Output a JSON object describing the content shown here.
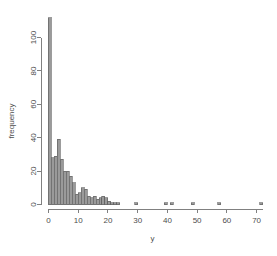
{
  "chart_data": {
    "type": "bar",
    "title": "",
    "subtitle": "",
    "xlabel": "y",
    "ylabel": "frequency",
    "xlim": [
      -1,
      74
    ],
    "ylim": [
      0,
      115
    ],
    "grid": false,
    "legend": null,
    "bin_width": 1,
    "x_ticks": [
      0,
      10,
      20,
      30,
      40,
      50,
      60,
      70
    ],
    "x_tick_labels": [
      "0",
      "10",
      "20",
      "30",
      "40",
      "50",
      "60",
      "70"
    ],
    "y_ticks": [
      0,
      20,
      40,
      60,
      80,
      100
    ],
    "y_tick_labels": [
      "0",
      "20",
      "40",
      "60",
      "80",
      "100"
    ],
    "bar_color": "#9a9a9a",
    "bar_border_color": "#5a5a5a",
    "axis_color": "#808080",
    "text_color": "#4d4d4d",
    "background": "#ffffff",
    "bin_starts": [
      0,
      1,
      2,
      3,
      4,
      5,
      6,
      7,
      8,
      9,
      10,
      11,
      12,
      13,
      14,
      15,
      16,
      17,
      18,
      19,
      20,
      21,
      22,
      23,
      24,
      25,
      26,
      27,
      28,
      29,
      30,
      31,
      32,
      33,
      34,
      35,
      36,
      37,
      38,
      39,
      40,
      41,
      42,
      43,
      44,
      45,
      46,
      47,
      48,
      49,
      50,
      51,
      52,
      53,
      54,
      55,
      56,
      57,
      58,
      59,
      60,
      61,
      62,
      63,
      64,
      65,
      66,
      67,
      68,
      69,
      70,
      71
    ],
    "values": [
      112,
      28,
      29,
      39,
      27,
      20,
      20,
      17,
      13,
      6,
      7,
      10,
      9,
      5,
      4,
      5,
      3,
      4,
      5,
      4,
      2,
      1,
      1,
      1,
      0,
      0,
      0,
      0,
      0,
      1,
      0,
      0,
      0,
      0,
      0,
      0,
      0,
      0,
      0,
      1,
      0,
      1,
      0,
      0,
      0,
      0,
      0,
      0,
      1,
      0,
      0,
      0,
      0,
      0,
      0,
      0,
      0,
      1,
      0,
      0,
      0,
      0,
      0,
      0,
      0,
      0,
      0,
      0,
      0,
      0,
      0,
      1
    ]
  }
}
